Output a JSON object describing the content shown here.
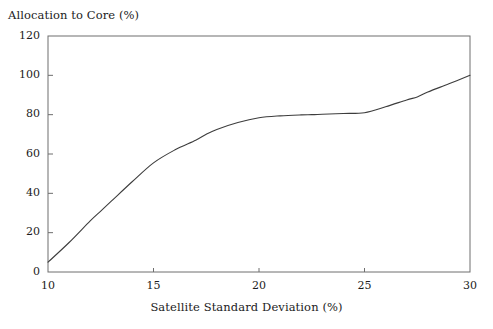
{
  "chart_data": {
    "type": "line",
    "title": "",
    "ylabel": "Allocation to Core (%)",
    "xlabel": "Satellite Standard Deviation (%)",
    "xlim": [
      10,
      30
    ],
    "ylim": [
      0,
      120
    ],
    "xticks": [
      10,
      15,
      20,
      25,
      30
    ],
    "yticks": [
      0,
      20,
      40,
      60,
      80,
      100,
      120
    ],
    "xtick_labels": [
      "10",
      "15",
      "20",
      "25",
      "30"
    ],
    "ytick_labels": [
      "0",
      "20",
      "40",
      "60",
      "80",
      "100",
      "120"
    ],
    "grid": false,
    "legend": false,
    "line_color": "#3d3d3d",
    "frame_color": "#6e6e6e",
    "background": "#ffffff",
    "series": [
      {
        "name": "Allocation to Core",
        "x": [
          10,
          11,
          12,
          12.5,
          13,
          14,
          15,
          16,
          17,
          17.5,
          18,
          19,
          20,
          21,
          22,
          22.5,
          23,
          24,
          25,
          26,
          27,
          27.5,
          28,
          29,
          30
        ],
        "values": [
          5,
          15,
          26,
          31,
          36,
          46,
          55.5,
          62,
          67,
          70,
          72.5,
          76,
          78.4,
          79.4,
          79.9,
          80,
          80.2,
          80.6,
          81,
          84,
          87.5,
          89,
          91.5,
          95.7,
          100
        ]
      }
    ]
  }
}
